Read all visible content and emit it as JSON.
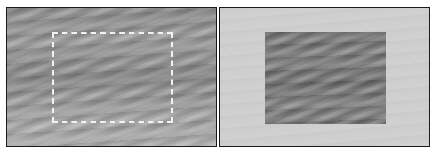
{
  "figure": {
    "panels": [
      {
        "id": "left",
        "description": "Streaked gray texture with a dashed rectangular selection marquee",
        "background_color": "#969696",
        "marquee": {
          "style": "dashed",
          "colors": [
            "#111111",
            "#f2f2f2"
          ]
        }
      },
      {
        "id": "right",
        "description": "Light gray background with the selected textured region shown alone",
        "background_color": "#cfcfcf",
        "region_color": "#808080"
      }
    ],
    "border_color": "#1a1a1a"
  }
}
